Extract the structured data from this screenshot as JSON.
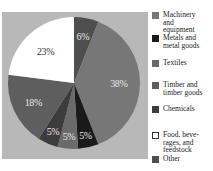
{
  "chart_data": {
    "type": "pie",
    "title": "",
    "categories": [
      "Other",
      "Machinery and equipment",
      "Metals and metal goods",
      "Textiles",
      "Chemicals",
      "Timber and timber goods",
      "Food, beverages, and feedstock"
    ],
    "values": [
      6,
      38,
      5,
      5,
      5,
      18,
      23
    ],
    "unit": "%",
    "start_angle_deg": 0,
    "direction": "clockwise",
    "labels": [
      "6%",
      "38%",
      "5%",
      "5%",
      "5%",
      "18%",
      "23%"
    ],
    "colors": [
      "#4e4e4e",
      "#777777",
      "#1a1a1a",
      "#6a6a6a",
      "#3c3c3c",
      "#5e5e5e",
      "#ffffff"
    ],
    "legend_position": "right"
  },
  "legend": {
    "items": [
      {
        "label": "Machinery\nand\nequipment",
        "color": "#777777"
      },
      {
        "label": "Metals and\nmetal goods",
        "color": "#1a1a1a"
      },
      {
        "label": "Textiles",
        "color": "#6a6a6a"
      },
      {
        "label": "Timber and\ntimber goods",
        "color": "#5e5e5e"
      },
      {
        "label": "Chemicals",
        "color": "#3c3c3c"
      },
      {
        "label": "Food, beve-\nrages, and\nfeedstock",
        "color": "#ffffff"
      },
      {
        "label": "Other",
        "color": "#4e4e4e"
      }
    ]
  }
}
